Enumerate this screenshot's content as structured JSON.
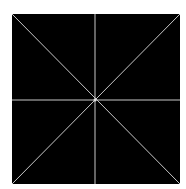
{
  "diagram": {
    "background": "#ffffff",
    "square": {
      "x": 12,
      "y": 14,
      "width": 168,
      "height": 170,
      "fill": "#000000"
    },
    "line_color": "#c8c8c8",
    "center": {
      "x": 95,
      "y": 100
    },
    "lines": [
      {
        "name": "vertical",
        "x1": 95,
        "y1": 14,
        "x2": 95,
        "y2": 184
      },
      {
        "name": "horizontal",
        "x1": 12,
        "y1": 100,
        "x2": 180,
        "y2": 100
      },
      {
        "name": "diagonal-tl-br",
        "x1": 12,
        "y1": 14,
        "x2": 180,
        "y2": 184
      },
      {
        "name": "diagonal-tr-bl",
        "x1": 180,
        "y1": 14,
        "x2": 12,
        "y2": 184
      }
    ]
  }
}
